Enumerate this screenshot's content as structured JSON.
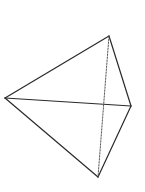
{
  "diagram": {
    "type": "tetrahedron",
    "background": "#ffffff",
    "stroke_color": "#2a2a2a",
    "hidden_stroke_color": "#555555",
    "vertices": {
      "top": {
        "x": 109,
        "y": 36
      },
      "left": {
        "x": 5,
        "y": 98
      },
      "right": {
        "x": 131,
        "y": 106
      },
      "bottom": {
        "x": 98,
        "y": 177
      }
    },
    "edges": [
      {
        "from": "left",
        "to": "top",
        "style": "solid"
      },
      {
        "from": "top",
        "to": "right",
        "style": "solid"
      },
      {
        "from": "left",
        "to": "right",
        "style": "solid"
      },
      {
        "from": "left",
        "to": "bottom",
        "style": "solid"
      },
      {
        "from": "right",
        "to": "bottom",
        "style": "solid"
      },
      {
        "from": "top",
        "to": "bottom",
        "style": "dotted"
      }
    ]
  }
}
